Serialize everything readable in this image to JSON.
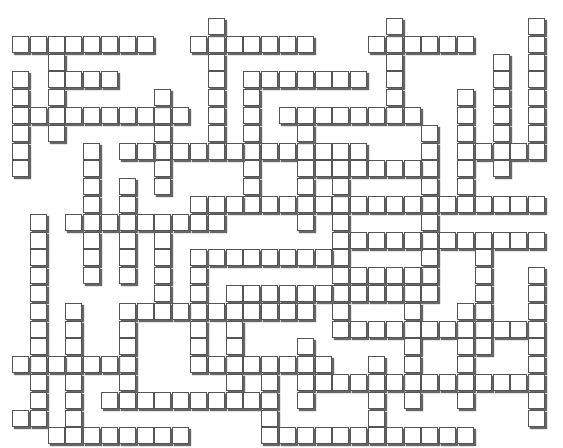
{
  "puzzle": {
    "type": "crossword",
    "cell_size": 17.8,
    "origin": {
      "x": 12,
      "y": 18
    },
    "runs": [
      {
        "dir": "h",
        "row": 1,
        "col": 0,
        "len": 8
      },
      {
        "dir": "h",
        "row": 1,
        "col": 10,
        "len": 7
      },
      {
        "dir": "h",
        "row": 1,
        "col": 20,
        "len": 6
      },
      {
        "dir": "v",
        "row": 0,
        "col": 11,
        "len": 8
      },
      {
        "dir": "v",
        "row": 0,
        "col": 21,
        "len": 6
      },
      {
        "dir": "v",
        "row": 0,
        "col": 29,
        "len": 8
      },
      {
        "dir": "v",
        "row": 2,
        "col": 2,
        "len": 5
      },
      {
        "dir": "h",
        "row": 3,
        "col": 2,
        "len": 4
      },
      {
        "dir": "v",
        "row": 3,
        "col": 0,
        "len": 6
      },
      {
        "dir": "h",
        "row": 5,
        "col": 0,
        "len": 10
      },
      {
        "dir": "v",
        "row": 4,
        "col": 8,
        "len": 6
      },
      {
        "dir": "h",
        "row": 3,
        "col": 13,
        "len": 7
      },
      {
        "dir": "v",
        "row": 3,
        "col": 13,
        "len": 8
      },
      {
        "dir": "h",
        "row": 5,
        "col": 15,
        "len": 8
      },
      {
        "dir": "v",
        "row": 2,
        "col": 27,
        "len": 7
      },
      {
        "dir": "v",
        "row": 4,
        "col": 25,
        "len": 6
      },
      {
        "dir": "h",
        "row": 7,
        "col": 25,
        "len": 5
      },
      {
        "dir": "v",
        "row": 7,
        "col": 4,
        "len": 8
      },
      {
        "dir": "h",
        "row": 7,
        "col": 6,
        "len": 14
      },
      {
        "dir": "v",
        "row": 6,
        "col": 23,
        "len": 9
      },
      {
        "dir": "v",
        "row": 6,
        "col": 16,
        "len": 6
      },
      {
        "dir": "h",
        "row": 8,
        "col": 16,
        "len": 8
      },
      {
        "dir": "v",
        "row": 9,
        "col": 6,
        "len": 6
      },
      {
        "dir": "h",
        "row": 10,
        "col": 10,
        "len": 9
      },
      {
        "dir": "h",
        "row": 10,
        "col": 19,
        "len": 11
      },
      {
        "dir": "v",
        "row": 11,
        "col": 1,
        "len": 11
      },
      {
        "dir": "h",
        "row": 11,
        "col": 3,
        "len": 9
      },
      {
        "dir": "v",
        "row": 9,
        "col": 18,
        "len": 8
      },
      {
        "dir": "h",
        "row": 12,
        "col": 18,
        "len": 6
      },
      {
        "dir": "h",
        "row": 12,
        "col": 24,
        "len": 6
      },
      {
        "dir": "v",
        "row": 12,
        "col": 8,
        "len": 4
      },
      {
        "dir": "h",
        "row": 13,
        "col": 11,
        "len": 7
      },
      {
        "dir": "v",
        "row": 13,
        "col": 10,
        "len": 7
      },
      {
        "dir": "v",
        "row": 13,
        "col": 26,
        "len": 6
      },
      {
        "dir": "h",
        "row": 14,
        "col": 19,
        "len": 5
      },
      {
        "dir": "v",
        "row": 14,
        "col": 22,
        "len": 8
      },
      {
        "dir": "h",
        "row": 15,
        "col": 12,
        "len": 12
      },
      {
        "dir": "v",
        "row": 16,
        "col": 3,
        "len": 7
      },
      {
        "dir": "v",
        "row": 16,
        "col": 6,
        "len": 5
      },
      {
        "dir": "h",
        "row": 16,
        "col": 7,
        "len": 10
      },
      {
        "dir": "v",
        "row": 16,
        "col": 12,
        "len": 5
      },
      {
        "dir": "v",
        "row": 16,
        "col": 25,
        "len": 6
      },
      {
        "dir": "v",
        "row": 14,
        "col": 29,
        "len": 9
      },
      {
        "dir": "h",
        "row": 17,
        "col": 18,
        "len": 12
      },
      {
        "dir": "h",
        "row": 19,
        "col": 0,
        "len": 6
      },
      {
        "dir": "v",
        "row": 18,
        "col": 16,
        "len": 4
      },
      {
        "dir": "h",
        "row": 19,
        "col": 10,
        "len": 8
      },
      {
        "dir": "v",
        "row": 19,
        "col": 20,
        "len": 4
      },
      {
        "dir": "h",
        "row": 20,
        "col": 17,
        "len": 13
      },
      {
        "dir": "h",
        "row": 21,
        "col": 5,
        "len": 10
      },
      {
        "dir": "h",
        "row": 22,
        "col": 0,
        "len": 2
      },
      {
        "dir": "v",
        "row": 20,
        "col": 14,
        "len": 4
      },
      {
        "dir": "h",
        "row": 23,
        "col": 2,
        "len": 8
      },
      {
        "dir": "h",
        "row": 23,
        "col": 14,
        "len": 12
      }
    ]
  }
}
